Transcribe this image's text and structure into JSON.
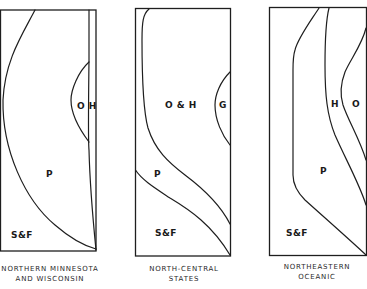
{
  "figure": {
    "panels": [
      {
        "id": "northern-minnesota",
        "caption_lines": [
          "NORTHERN MINNESOTA",
          "AND WISCONSIN"
        ],
        "zones": [
          {
            "label": "O H",
            "name": "oak-hickory"
          },
          {
            "label": "P",
            "name": "pine"
          },
          {
            "label": "S&F",
            "name": "spruce-fir"
          }
        ]
      },
      {
        "id": "north-central",
        "caption_lines": [
          "NORTH-CENTRAL",
          "STATES"
        ],
        "zones": [
          {
            "label": "O & H",
            "name": "oak-hemlock"
          },
          {
            "label": "G",
            "name": "grass"
          },
          {
            "label": "P",
            "name": "pine"
          },
          {
            "label": "S&F",
            "name": "spruce-fir"
          }
        ]
      },
      {
        "id": "northeastern-oceanic",
        "caption_lines": [
          "NORTHEASTERN",
          "OCEANIC"
        ],
        "zones": [
          {
            "label": "H",
            "name": "hemlock"
          },
          {
            "label": "O",
            "name": "oak"
          },
          {
            "label": "P",
            "name": "pine"
          },
          {
            "label": "S&F",
            "name": "spruce-fir"
          }
        ]
      }
    ]
  }
}
